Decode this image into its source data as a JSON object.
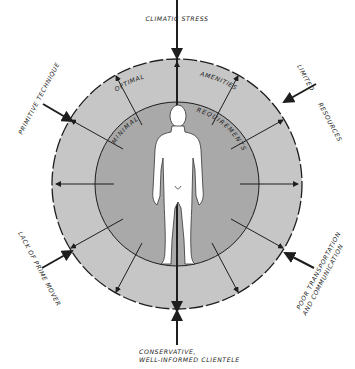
{
  "diagram": {
    "center": {
      "x": 177,
      "y": 184
    },
    "outer_radius": 125,
    "inner_radius": 82,
    "colors": {
      "outer_ring": "#c6c6c6",
      "inner_ring": "#a9a9a9",
      "figure": "#ffffff",
      "stroke": "#1e1e1e"
    },
    "inner_label_left": "MINIMAL",
    "inner_label_right": "REQUIREMENTS",
    "outer_label_left": "OPTIMAL",
    "outer_label_right": "AMENITIES",
    "center_figure": "human figure",
    "external_pressures": [
      {
        "id": "climatic-stress",
        "label": "CLIMATIC STRESS",
        "angle": 90
      },
      {
        "id": "limited-resources",
        "label_line1": "LIMITED",
        "label_line2": "RESOURCES",
        "angle": 35
      },
      {
        "id": "poor-transportation",
        "label_line1": "POOR TRANSPORTATION",
        "label_line2": "AND COMMUNICATION",
        "angle": -30
      },
      {
        "id": "conservative-clientele",
        "label_line1": "CONSERVATIVE,",
        "label_line2": "WELL-INFORMED CLIENTELE",
        "angle": -90
      },
      {
        "id": "lack-of-prime-mover",
        "label": "LACK OF PRIME MOVER",
        "angle": 210
      },
      {
        "id": "primitive-technique",
        "label": "PRIMITIVE TECHNIQUE",
        "angle": 145
      }
    ]
  }
}
